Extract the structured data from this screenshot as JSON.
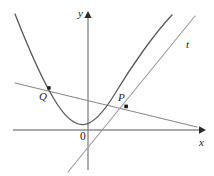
{
  "figure": {
    "kind": "math-diagram",
    "background_color": "#ffffff"
  },
  "axes": {
    "x_axis": {
      "label": "x",
      "name": "x-axis",
      "y_pixel": 130,
      "x_start": 13,
      "x_end": 205,
      "arrow": "right",
      "color": "#8d8d8d"
    },
    "y_axis": {
      "label": "y",
      "name": "y-axis",
      "x_pixel": 88,
      "y_top": 12,
      "y_bottom": 170,
      "arrow": "up",
      "color": "#8d8d8d"
    },
    "origin": {
      "label": "0",
      "x_pixel": 88,
      "y_pixel": 130
    }
  },
  "curves": [
    {
      "name": "parabola",
      "label": "",
      "color": "#595959",
      "vertex": [
        83,
        124
      ],
      "path": "M 15,14 Q 40,76 62,106 Q 76,125 83,124 Q 92,123 108,97 Q 132,58 172,15",
      "left_end": [
        15,
        14
      ],
      "right_end": [
        172,
        15
      ]
    },
    {
      "name": "secant-line-QP",
      "label": "",
      "color": "#8a8a8a",
      "from": [
        15,
        83
      ],
      "to": [
        197,
        127
      ]
    },
    {
      "name": "tangent-line-t",
      "label": "t",
      "color": "#9a9a9a",
      "from": [
        68,
        172
      ],
      "to": [
        195,
        16
      ]
    }
  ],
  "points": [
    {
      "name": "point-Q",
      "label": "Q",
      "x_pixel": 49,
      "y_pixel": 88,
      "label_x": 39,
      "label_y": 91,
      "color": "#1a1a1a"
    },
    {
      "name": "point-P",
      "label": "P",
      "x_pixel": 126,
      "y_pixel": 106,
      "label_x": 118,
      "label_y": 92,
      "color": "#1a1a1a"
    }
  ],
  "labels": {
    "y_axis_label": "y",
    "x_axis_label": "x",
    "tangent_label": "t",
    "point_p_label": "P",
    "point_q_label": "Q",
    "origin_label": "0"
  }
}
